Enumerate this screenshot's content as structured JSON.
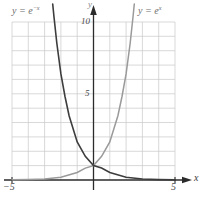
{
  "chart_data": {
    "type": "line",
    "title": "",
    "subtitle": "",
    "xlabel": "x",
    "ylabel": "y",
    "xlim": [
      -5,
      5
    ],
    "ylim": [
      0,
      11
    ],
    "grid": true,
    "grid_step_x": 1,
    "grid_step_y": 1,
    "legend_position": "inline-annotations",
    "x_tick_labels": [
      "−5",
      "5"
    ],
    "x_tick_values": [
      -5,
      5
    ],
    "y_tick_labels": [
      "5",
      "10"
    ],
    "y_tick_values": [
      5,
      10
    ],
    "annotations": [
      {
        "text_html": "y = e<sup>−x</sup>",
        "text": "y = e^(-x)",
        "x": -4.2,
        "y": 11.4
      },
      {
        "text_html": "y = e<sup>x</sup>",
        "text": "y = e^x",
        "x": 3.0,
        "y": 11.4
      }
    ],
    "series": [
      {
        "name": "y = e^(-x)",
        "color": "#3d3d3d",
        "x": [
          -5,
          -4.5,
          -4,
          -3.5,
          -3,
          -2.5,
          -2,
          -1.5,
          -1,
          -0.5,
          0,
          0.5,
          1,
          1.5,
          2,
          2.5,
          3,
          3.5,
          4,
          4.5,
          5
        ],
        "values": [
          148.41,
          90.02,
          54.6,
          33.12,
          20.09,
          12.18,
          7.39,
          4.48,
          2.72,
          1.65,
          1,
          0.61,
          0.37,
          0.22,
          0.14,
          0.08,
          0.05,
          0.03,
          0.02,
          0.01,
          0.01
        ]
      },
      {
        "name": "y = e^x",
        "color": "#9a9a9a",
        "x": [
          -5,
          -4.5,
          -4,
          -3.5,
          -3,
          -2.5,
          -2,
          -1.5,
          -1,
          -0.5,
          0,
          0.5,
          1,
          1.5,
          2,
          2.5,
          3,
          3.5,
          4,
          4.5,
          5
        ],
        "values": [
          0.01,
          0.01,
          0.02,
          0.03,
          0.05,
          0.08,
          0.14,
          0.22,
          0.37,
          0.61,
          1,
          1.65,
          2.72,
          4.48,
          7.39,
          12.18,
          20.09,
          33.12,
          54.6,
          90.02,
          148.41
        ]
      }
    ],
    "intersection_point": {
      "x": 0,
      "y": 1
    }
  },
  "axes": {
    "x_axis_label": "x",
    "y_axis_label": "y",
    "x_left_tick": "−5",
    "x_right_tick": "5",
    "y_tick_5": "5",
    "y_tick_10": "10"
  },
  "colors": {
    "grid": "#c9c9c9",
    "axis": "#2b2b2b",
    "curve_dark": "#3d3d3d",
    "curve_light": "#9a9a9a",
    "background": "#ffffff",
    "label": "#6e6e6e"
  }
}
